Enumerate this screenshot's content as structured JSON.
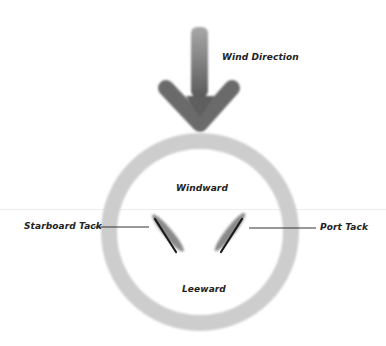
{
  "diagram": {
    "labels": {
      "wind_direction": "Wind Direction",
      "windward": "Windward",
      "leeward": "Leeward",
      "starboard_tack": "Starboard Tack",
      "port_tack": "Port Tack"
    },
    "colors": {
      "arrow": "#6e6e6e",
      "circle": "#cdcdcd",
      "sail": "#8a8a8a",
      "boom": "#1a1a1a",
      "leader_line": "#333333",
      "text": "#222222"
    }
  }
}
